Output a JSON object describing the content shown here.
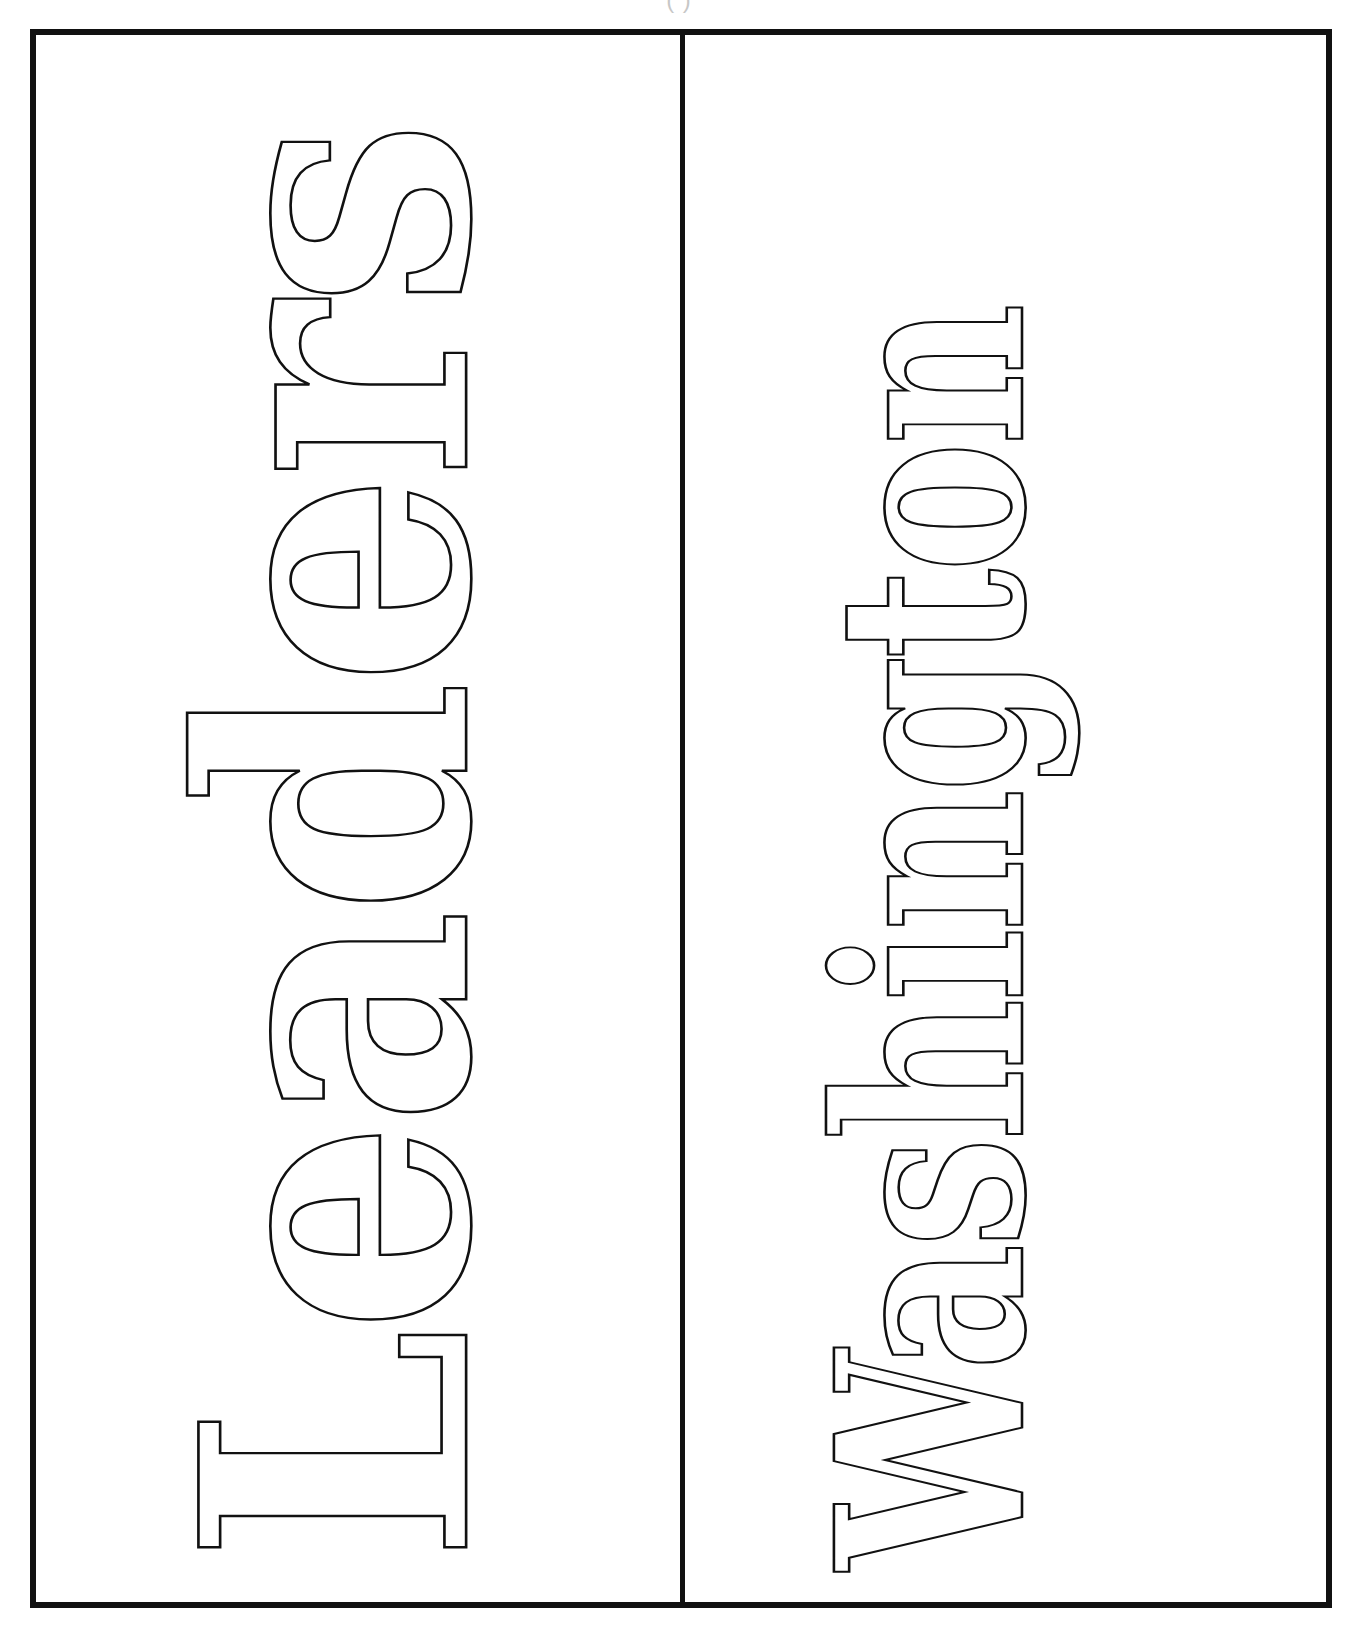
{
  "header": {
    "partial_text": "( )"
  },
  "worksheet": {
    "panels": [
      {
        "word": "Leaders",
        "orientation": "rotated-90-ccw",
        "style": "outlined-bold-slab"
      },
      {
        "word": "Washington",
        "orientation": "rotated-90-ccw",
        "style": "outlined-bold-slab"
      }
    ],
    "colors": {
      "stroke": "#111111",
      "background": "#ffffff"
    }
  }
}
